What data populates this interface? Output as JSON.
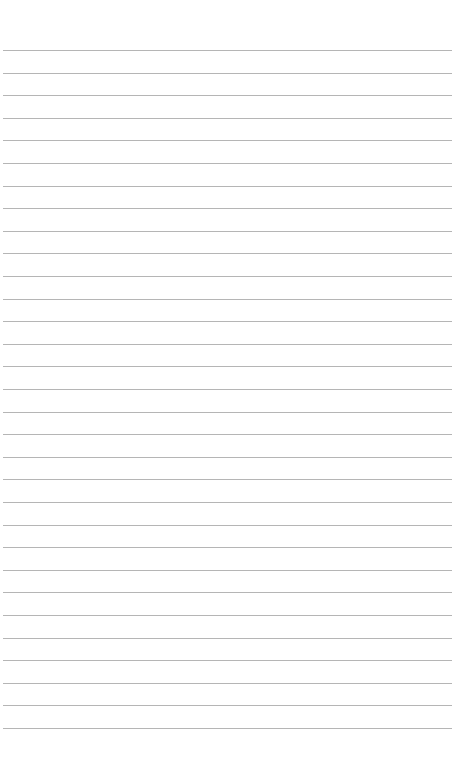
{
  "document": {
    "type": "lined-paper",
    "line_count": 31,
    "line_color": "#a8a8a8",
    "background_color": "#ffffff",
    "text": ""
  }
}
